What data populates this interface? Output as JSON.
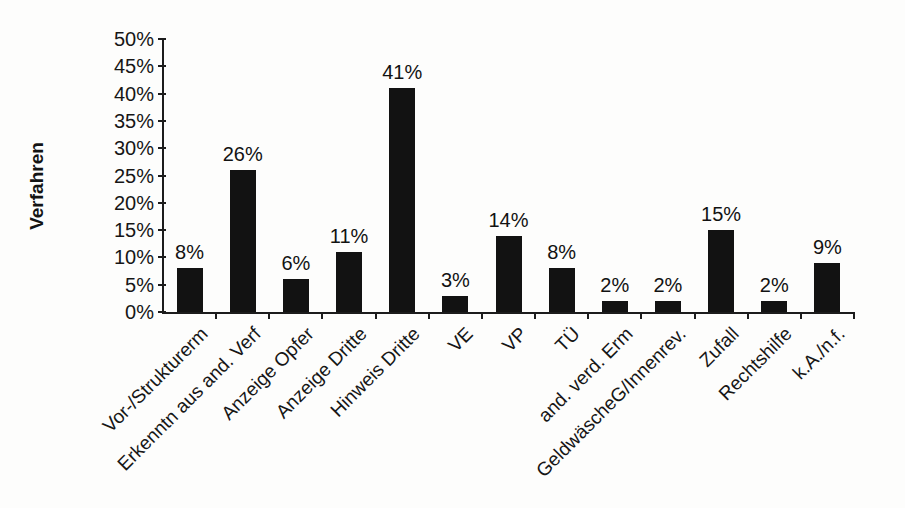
{
  "chart_data": {
    "type": "bar",
    "title": "",
    "xlabel": "",
    "ylabel": "Verfahren",
    "categories": [
      "Vor-/Strukturerm",
      "Erkenntn aus and. Verf",
      "Anzeige Opfer",
      "Anzeige Dritte",
      "Hinweis Dritte",
      "VE",
      "VP",
      "TÜ",
      "and. verd. Erm",
      "GeldwäscheG/Innenrev.",
      "Zufall",
      "Rechtshilfe",
      "k.A./n.f."
    ],
    "values": [
      8,
      26,
      6,
      11,
      41,
      3,
      14,
      8,
      2,
      2,
      15,
      2,
      9
    ],
    "value_labels": [
      "8%",
      "26%",
      "6%",
      "11%",
      "41%",
      "3%",
      "14%",
      "8%",
      "2%",
      "2%",
      "15%",
      "2%",
      "9%"
    ],
    "y_ticks": [
      "0%",
      "5%",
      "10%",
      "15%",
      "20%",
      "25%",
      "30%",
      "35%",
      "40%",
      "45%",
      "50%"
    ],
    "ylim": [
      0,
      50
    ],
    "y_tick_step": 5,
    "grid": false,
    "legend_position": "none",
    "bar_color": "#121212",
    "axis_color": "#1c1c1c",
    "background_color": "#fdfdfc"
  }
}
